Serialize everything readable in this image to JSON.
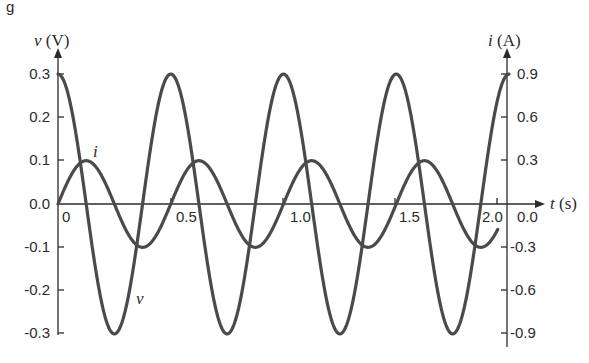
{
  "figure": {
    "partial_caption_glyph": "g"
  },
  "chart_data": {
    "type": "line",
    "title": "",
    "xlabel": "t (s)",
    "ylabel_left": "v (V)",
    "ylabel_right": "i (A)",
    "xlim": [
      0,
      2.0
    ],
    "ylim_left": [
      -0.3,
      0.3
    ],
    "ylim_right": [
      -0.9,
      0.9
    ],
    "x_ticks": [
      "0",
      "0.5",
      "1.0",
      "1.5",
      "2.0"
    ],
    "y_ticks_left": [
      "0.3",
      "0.2",
      "0.1",
      "0.0",
      "-0.1",
      "-0.2",
      "-0.3"
    ],
    "y_ticks_right": [
      "0.9",
      "0.6",
      "0.3",
      "0.0",
      "-0.3",
      "-0.6",
      "-0.9"
    ],
    "grid": false,
    "series": [
      {
        "name": "v",
        "label": "v",
        "axis": "left",
        "formula": "v(t) = 0.3 cos(4πt)",
        "amplitude": 0.3,
        "period": 0.5,
        "x": [
          0,
          0.125,
          0.25,
          0.375,
          0.5,
          0.625,
          0.75,
          0.875,
          1.0,
          1.125,
          1.25,
          1.375,
          1.5,
          1.625,
          1.75,
          1.875,
          2.0
        ],
        "values": [
          0.3,
          0,
          -0.3,
          0,
          0.3,
          0,
          -0.3,
          0,
          0.3,
          0,
          -0.3,
          0,
          0.3,
          0,
          -0.3,
          0,
          0.3
        ]
      },
      {
        "name": "i",
        "label": "i",
        "axis": "right",
        "formula": "i(t) = 0.3 sin(4πt)",
        "amplitude": 0.3,
        "period": 0.5,
        "x": [
          0,
          0.125,
          0.25,
          0.375,
          0.5,
          0.625,
          0.75,
          0.875,
          1.0,
          1.125,
          1.25,
          1.375,
          1.5,
          1.625,
          1.75,
          1.875,
          2.0
        ],
        "values": [
          0,
          0.3,
          0,
          -0.3,
          0,
          0.3,
          0,
          -0.3,
          0,
          0.3,
          0,
          -0.3,
          0,
          0.3,
          0,
          -0.3,
          0
        ]
      }
    ],
    "annotations": [
      {
        "text": "i",
        "near": "first peak of i curve"
      },
      {
        "text": "v",
        "near": "first trough of v curve"
      }
    ]
  }
}
